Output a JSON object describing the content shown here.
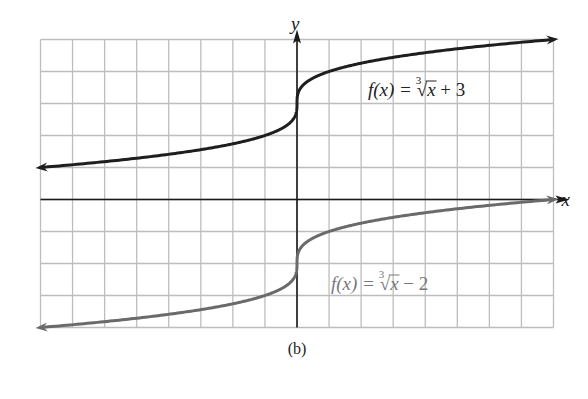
{
  "figure": {
    "caption": "(b)",
    "axis_labels": {
      "x": "x",
      "y": "y"
    }
  },
  "colors": {
    "background": "#ffffff",
    "grid": "#bdbdbd",
    "axis": "#1a1a1a",
    "curve_top": "#1e1e1e",
    "curve_bottom": "#6a6a6a",
    "label_top": "#222222",
    "label_bottom": "#777777"
  },
  "chart_data": {
    "type": "line",
    "title": "",
    "xlabel": "x",
    "ylabel": "y",
    "xlim": [
      -8,
      8
    ],
    "ylim": [
      -4,
      5
    ],
    "grid": true,
    "grid_step": 1,
    "tick_labels_shown": false,
    "legend": "inline annotations",
    "series": [
      {
        "name": "f(x) = ∛x + 3",
        "label_parts": {
          "prefix": "f(x) = ",
          "root_index": "3",
          "radicand": "x",
          "suffix": " + 3"
        },
        "formula": "cbrt(x) + 3",
        "x": [
          -8,
          -6,
          -4,
          -2,
          -1,
          -0.5,
          -0.125,
          0,
          0.125,
          0.5,
          1,
          2,
          4,
          6,
          8
        ],
        "y": [
          1,
          1.18,
          1.41,
          1.74,
          2,
          2.21,
          2.5,
          3,
          3.5,
          3.79,
          4,
          4.26,
          4.59,
          4.82,
          5
        ],
        "arrows": "both",
        "color": "#1e1e1e"
      },
      {
        "name": "f(x) = ∛x − 2",
        "label_parts": {
          "prefix": "f(x) = ",
          "root_index": "3",
          "radicand": "x",
          "suffix": " − 2"
        },
        "formula": "cbrt(x) - 2",
        "x": [
          -8,
          -6,
          -4,
          -2,
          -1,
          -0.5,
          -0.125,
          0,
          0.125,
          0.5,
          1,
          2,
          4,
          6,
          8
        ],
        "y": [
          -4,
          -3.82,
          -3.59,
          -3.26,
          -3,
          -2.79,
          -2.5,
          -2,
          -1.5,
          -1.21,
          -1,
          -0.74,
          -0.41,
          -0.18,
          0
        ],
        "arrows": "both",
        "color": "#6a6a6a"
      }
    ],
    "annotations": [
      {
        "text": "f(x) = ∛x + 3",
        "near": [
          5,
          3.2
        ]
      },
      {
        "text": "f(x) = ∛x − 2",
        "near": [
          3.5,
          -2.8
        ]
      }
    ]
  }
}
